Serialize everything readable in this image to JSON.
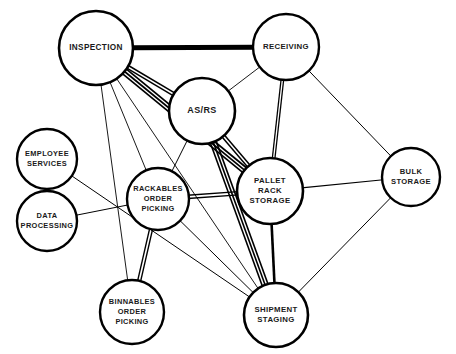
{
  "diagram": {
    "type": "node-link-network",
    "canvas": {
      "width": 456,
      "height": 354,
      "background": "#ffffff"
    },
    "style": {
      "node_fill": "#ffffff",
      "node_stroke": "#000000",
      "edge_color": "#000000",
      "label_color": "#1a1a1a"
    },
    "nodes": [
      {
        "id": "inspection",
        "label": "INSPECTION",
        "lines": [
          "INSPECTION"
        ],
        "cx": 96,
        "cy": 48,
        "r": 37,
        "stroke_width": 2.6,
        "font_size": 8.2
      },
      {
        "id": "receiving",
        "label": "RECEIVING",
        "lines": [
          "RECEIVING"
        ],
        "cx": 286,
        "cy": 47,
        "r": 33,
        "stroke_width": 2.4,
        "font_size": 7.8
      },
      {
        "id": "asrs",
        "label": "AS/RS",
        "lines": [
          "AS/RS"
        ],
        "cx": 202,
        "cy": 111,
        "r": 33,
        "stroke_width": 2.6,
        "font_size": 9.0
      },
      {
        "id": "employee_services",
        "label": "EMPLOYEE SERVICES",
        "lines": [
          "EMPLOYEE",
          "SERVICES"
        ],
        "cx": 47,
        "cy": 159,
        "r": 30,
        "stroke_width": 2.4,
        "font_size": 7.4
      },
      {
        "id": "data_processing",
        "label": "DATA PROCESSING",
        "lines": [
          "DATA",
          "PROCESSING"
        ],
        "cx": 47,
        "cy": 221,
        "r": 30,
        "stroke_width": 2.4,
        "font_size": 7.4
      },
      {
        "id": "rackables_order_picking",
        "label": "RACKABLES ORDER PICKING",
        "lines": [
          "RACKABLES",
          "ORDER",
          "PICKING"
        ],
        "cx": 158,
        "cy": 199,
        "r": 31,
        "stroke_width": 2.4,
        "font_size": 7.4
      },
      {
        "id": "pallet_rack_storage",
        "label": "PALLET RACK STORAGE",
        "lines": [
          "PALLET",
          "RACK",
          "STORAGE"
        ],
        "cx": 270,
        "cy": 191,
        "r": 33,
        "stroke_width": 2.6,
        "font_size": 7.8
      },
      {
        "id": "bulk_storage",
        "label": "BULK STORAGE",
        "lines": [
          "BULK",
          "STORAGE"
        ],
        "cx": 411,
        "cy": 177,
        "r": 29,
        "stroke_width": 2.4,
        "font_size": 7.6
      },
      {
        "id": "binnables_order_picking",
        "label": "BINNABLES ORDER PICKING",
        "lines": [
          "BINNABLES",
          "ORDER",
          "PICKING"
        ],
        "cx": 132,
        "cy": 312,
        "r": 32,
        "stroke_width": 2.4,
        "font_size": 7.4
      },
      {
        "id": "shipment_staging",
        "label": "SHIPMENT STAGING",
        "lines": [
          "SHIPMENT",
          "STAGING"
        ],
        "cx": 276,
        "cy": 315,
        "r": 32,
        "stroke_width": 2.6,
        "font_size": 7.8
      }
    ],
    "edges": [
      {
        "id": "inspection-receiving",
        "from": "inspection",
        "to": "receiving",
        "strength": 5,
        "rank": "A",
        "kind": "thick-single",
        "width": 5.0,
        "count": 1,
        "gap": 0
      },
      {
        "id": "inspection-asrs",
        "from": "inspection",
        "to": "asrs",
        "strength": 3,
        "rank": "I",
        "kind": "double",
        "width": 1.5,
        "count": 2,
        "gap": 3.0
      },
      {
        "id": "inspection-pallet_rack_storage",
        "from": "inspection",
        "to": "pallet_rack_storage",
        "strength": 4,
        "rank": "E",
        "kind": "triple",
        "width": 1.7,
        "count": 3,
        "gap": 3.0
      },
      {
        "id": "inspection-rackables_order_picking",
        "from": "inspection",
        "to": "rackables_order_picking",
        "strength": 1,
        "rank": "O",
        "kind": "thin-single",
        "width": 0.9,
        "count": 1,
        "gap": 0
      },
      {
        "id": "inspection-binnables_order_picking",
        "from": "inspection",
        "to": "binnables_order_picking",
        "strength": 1,
        "rank": "O",
        "kind": "thin-single",
        "width": 0.9,
        "count": 1,
        "gap": 0
      },
      {
        "id": "inspection-shipment_staging",
        "from": "inspection",
        "to": "shipment_staging",
        "strength": 1,
        "rank": "O",
        "kind": "thin-single",
        "width": 0.9,
        "count": 1,
        "gap": 0
      },
      {
        "id": "receiving-asrs",
        "from": "receiving",
        "to": "asrs",
        "strength": 1,
        "rank": "O",
        "kind": "thin-single",
        "width": 0.9,
        "count": 1,
        "gap": 0
      },
      {
        "id": "receiving-pallet_rack_storage",
        "from": "receiving",
        "to": "pallet_rack_storage",
        "strength": 3,
        "rank": "I",
        "kind": "double",
        "width": 1.3,
        "count": 2,
        "gap": 2.6
      },
      {
        "id": "receiving-bulk_storage",
        "from": "receiving",
        "to": "bulk_storage",
        "strength": 1,
        "rank": "O",
        "kind": "thin-single",
        "width": 1.0,
        "count": 1,
        "gap": 0
      },
      {
        "id": "asrs-rackables_order_picking",
        "from": "asrs",
        "to": "rackables_order_picking",
        "strength": 1,
        "rank": "O",
        "kind": "thin-single",
        "width": 1.0,
        "count": 1,
        "gap": 0
      },
      {
        "id": "asrs-pallet_rack_storage",
        "from": "asrs",
        "to": "pallet_rack_storage",
        "strength": 3,
        "rank": "I",
        "kind": "double",
        "width": 1.5,
        "count": 2,
        "gap": 3.0
      },
      {
        "id": "asrs-shipment_staging",
        "from": "asrs",
        "to": "shipment_staging",
        "strength": 4,
        "rank": "E",
        "kind": "triple",
        "width": 1.6,
        "count": 3,
        "gap": 3.0
      },
      {
        "id": "employee_services-shipment_staging",
        "from": "employee_services",
        "to": "shipment_staging",
        "strength": 1,
        "rank": "O",
        "kind": "thin-single",
        "width": 1.0,
        "count": 1,
        "gap": 0
      },
      {
        "id": "data_processing-rackables_order_picking",
        "from": "data_processing",
        "to": "rackables_order_picking",
        "strength": 1,
        "rank": "O",
        "kind": "thin-single",
        "width": 1.0,
        "count": 1,
        "gap": 0
      },
      {
        "id": "rackables_order_picking-pallet_rack_storage",
        "from": "rackables_order_picking",
        "to": "pallet_rack_storage",
        "strength": 3,
        "rank": "I",
        "kind": "double",
        "width": 1.4,
        "count": 2,
        "gap": 3.2
      },
      {
        "id": "rackables_order_picking-binnables_order_picking",
        "from": "rackables_order_picking",
        "to": "binnables_order_picking",
        "strength": 3,
        "rank": "I",
        "kind": "double",
        "width": 1.4,
        "count": 2,
        "gap": 3.0
      },
      {
        "id": "rackables_order_picking-shipment_staging",
        "from": "rackables_order_picking",
        "to": "shipment_staging",
        "strength": 1,
        "rank": "O",
        "kind": "thin-single",
        "width": 1.0,
        "count": 1,
        "gap": 0
      },
      {
        "id": "pallet_rack_storage-bulk_storage",
        "from": "pallet_rack_storage",
        "to": "bulk_storage",
        "strength": 1,
        "rank": "O",
        "kind": "thin-single",
        "width": 1.2,
        "count": 1,
        "gap": 0
      },
      {
        "id": "pallet_rack_storage-shipment_staging",
        "from": "pallet_rack_storage",
        "to": "shipment_staging",
        "strength": 4,
        "rank": "E",
        "kind": "thick-single",
        "width": 2.6,
        "count": 1,
        "gap": 0
      },
      {
        "id": "bulk_storage-shipment_staging",
        "from": "bulk_storage",
        "to": "shipment_staging",
        "strength": 1,
        "rank": "O",
        "kind": "thin-single",
        "width": 1.0,
        "count": 1,
        "gap": 0
      }
    ]
  }
}
